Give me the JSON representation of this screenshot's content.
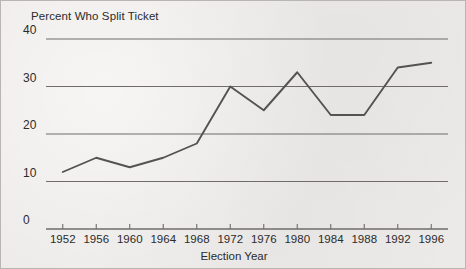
{
  "figure": {
    "background_color": "#eceae8",
    "border_color": "#b9b6b2",
    "ink_color": "#4a4a4a",
    "text_color": "#2b2b2b"
  },
  "chart_data": {
    "type": "line",
    "title": "Percent Who Split Ticket",
    "xlabel": "Election Year",
    "ylabel": "",
    "categories": [
      "1952",
      "1956",
      "1960",
      "1964",
      "1968",
      "1972",
      "1976",
      "1980",
      "1984",
      "1988",
      "1992",
      "1996"
    ],
    "x": [
      1952,
      1956,
      1960,
      1964,
      1968,
      1972,
      1976,
      1980,
      1984,
      1988,
      1992,
      1996
    ],
    "values": [
      12,
      15,
      13,
      15,
      18,
      30,
      25,
      33,
      24,
      24,
      34,
      35
    ],
    "series": [
      {
        "name": "Percent Who Split Ticket",
        "values": [
          12,
          15,
          13,
          15,
          18,
          30,
          25,
          33,
          24,
          24,
          34,
          35
        ]
      }
    ],
    "xlim": [
      1950,
      1998
    ],
    "ylim": [
      0,
      40
    ],
    "yticks": [
      0,
      10,
      20,
      30,
      40
    ],
    "ytick_labels": [
      "0",
      "10",
      "20",
      "30",
      "40"
    ],
    "xtick_labels": [
      "1952",
      "1956",
      "1960",
      "1964",
      "1968",
      "1972",
      "1976",
      "1980",
      "1984",
      "1988",
      "1992",
      "1996"
    ],
    "grid": "horizontal",
    "legend": "none",
    "line_color": "#555252",
    "gridline_color": "#6f6c6a",
    "markers": "none"
  }
}
